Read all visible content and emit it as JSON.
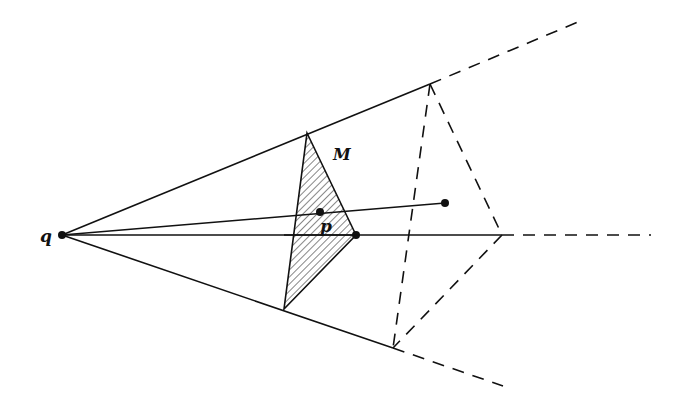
{
  "figure": {
    "colors": {
      "stroke": "#111111",
      "background": "#ffffff",
      "hatch": "#222222"
    },
    "points": {
      "q": [
        62,
        235
      ],
      "M_top": [
        307,
        133
      ],
      "M_right": [
        356,
        235
      ],
      "M_bottom": [
        284,
        309
      ],
      "p": [
        320,
        212
      ],
      "far_top": [
        430,
        84
      ],
      "far_right": [
        502,
        235
      ],
      "far_bottom": [
        393,
        348
      ],
      "segment_end": [
        445,
        203
      ],
      "ray_top_end": [
        578,
        22
      ],
      "ray_mid_end": [
        651,
        235
      ],
      "ray_bottom_end": [
        503,
        386
      ]
    },
    "labels": {
      "q": {
        "text": "q",
        "x": 40,
        "y": 242
      },
      "M": {
        "text": "M",
        "x": 333,
        "y": 160
      },
      "p": {
        "text": "p",
        "x": 320,
        "y": 232
      }
    }
  }
}
